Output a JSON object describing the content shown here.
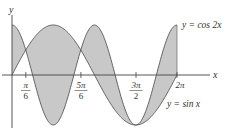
{
  "chart_data": {
    "type": "area",
    "title": "",
    "xlabel": "x",
    "ylabel": "y",
    "xlim": [
      0,
      6.2832
    ],
    "ylim": [
      -1,
      1
    ],
    "grid": false,
    "series": [
      {
        "name": "y = cos 2x",
        "function": "cos(2x)"
      },
      {
        "name": "y = sin x",
        "function": "sin(x)"
      }
    ],
    "shaded_region": "between curves from x = 0 to x = 2π",
    "intersections": [
      "π/6",
      "5π/6",
      "3π/2"
    ],
    "x_ticks": [
      {
        "value": 0.5236,
        "num": "π",
        "den": "6"
      },
      {
        "value": 2.618,
        "num": "5π",
        "den": "6"
      },
      {
        "value": 4.7124,
        "num": "3π",
        "den": "2"
      },
      {
        "value": 6.2832,
        "label": "2π"
      }
    ],
    "annotations": [
      {
        "text": "y = cos 2x",
        "position": "upper right, at end of cos 2x curve"
      },
      {
        "text": "y = sin x",
        "position": "lower right, below sin x curve end"
      }
    ]
  },
  "labels": {
    "y_axis": "y",
    "x_axis": "x",
    "cos_label": "y = cos 2x",
    "sin_label": "y = sin x",
    "tick_pi6_num": "π",
    "tick_pi6_den": "6",
    "tick_5pi6_num": "5π",
    "tick_5pi6_den": "6",
    "tick_3pi2_num": "3π",
    "tick_3pi2_den": "2",
    "tick_2pi": "2π"
  },
  "colors": {
    "fill": "#c8c8c8",
    "curve": "#555555",
    "axis": "#444444"
  }
}
